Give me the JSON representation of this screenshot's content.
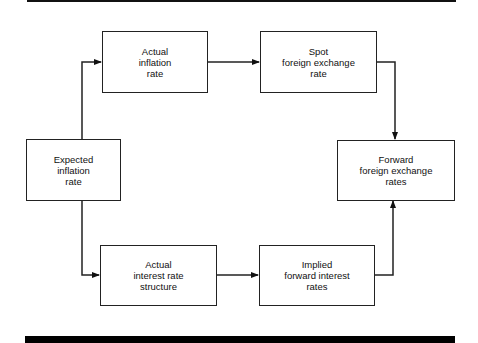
{
  "diagram": {
    "nodes": [
      {
        "id": "expected_inflation",
        "label": "Expected\ninflation\nrate"
      },
      {
        "id": "actual_inflation",
        "label": "Actual\ninflation\nrate"
      },
      {
        "id": "spot_fx",
        "label": "Spot\nforeign exchange\nrate"
      },
      {
        "id": "forward_fx",
        "label": "Forward\nforeign exchange\nrates"
      },
      {
        "id": "actual_interest",
        "label": "Actual\ninterest rate\nstructure"
      },
      {
        "id": "implied_forward",
        "label": "Implied\nforward interest\nrates"
      }
    ],
    "edges": [
      {
        "from": "expected_inflation",
        "to": "actual_inflation"
      },
      {
        "from": "expected_inflation",
        "to": "actual_interest"
      },
      {
        "from": "actual_inflation",
        "to": "spot_fx"
      },
      {
        "from": "spot_fx",
        "to": "forward_fx"
      },
      {
        "from": "actual_interest",
        "to": "implied_forward"
      },
      {
        "from": "implied_forward",
        "to": "forward_fx"
      }
    ],
    "colors": {
      "line": "#222222",
      "background": "#ffffff",
      "rule": "#000000"
    }
  }
}
